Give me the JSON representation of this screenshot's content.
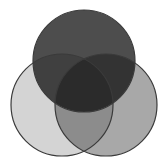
{
  "figure": {
    "name": "three-circle-venn-diagram",
    "background_color": "#ffffff",
    "width": 168,
    "height": 166,
    "blend_mode": "multiply",
    "outline_color": "#3a3a3a",
    "outline_width": 1.2
  },
  "chart_data": {
    "type": "venn",
    "title": "",
    "subtitle": "",
    "xlabel": "",
    "ylabel": "",
    "grid": false,
    "legend_position": "none",
    "set_count": 3,
    "sets": [
      {
        "id": "top",
        "label": "",
        "fill": "#4d4d4d",
        "cx": 84,
        "cy": 61,
        "r": 51,
        "tone": "dark-gray"
      },
      {
        "id": "left",
        "label": "",
        "fill": "#d4d4d4",
        "cx": 62,
        "cy": 105,
        "r": 51,
        "tone": "light-gray"
      },
      {
        "id": "right",
        "label": "",
        "fill": "#a8a8a8",
        "cx": 106,
        "cy": 105,
        "r": 51,
        "tone": "medium-gray"
      }
    ],
    "regions": [
      {
        "id": "top-only",
        "members": [
          "top"
        ],
        "observed_color": "#4d4d4d"
      },
      {
        "id": "left-only",
        "members": [
          "left"
        ],
        "observed_color": "#d4d4d4"
      },
      {
        "id": "right-only",
        "members": [
          "right"
        ],
        "observed_color": "#a8a8a8"
      },
      {
        "id": "top-left",
        "members": [
          "top",
          "left"
        ],
        "observed_color": "#333333"
      },
      {
        "id": "top-right",
        "members": [
          "top",
          "right"
        ],
        "observed_color": "#282828"
      },
      {
        "id": "left-right",
        "members": [
          "left",
          "right"
        ],
        "observed_color": "#8c8c8c"
      },
      {
        "id": "center-all",
        "members": [
          "top",
          "left",
          "right"
        ],
        "observed_color": "#050505"
      }
    ],
    "annotations": []
  }
}
